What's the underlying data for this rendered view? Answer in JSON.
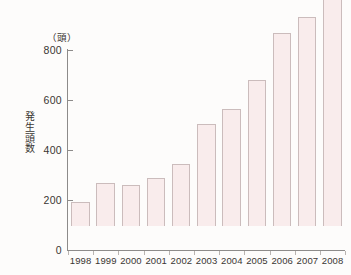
{
  "chart_data": {
    "type": "bar",
    "title": "",
    "subtitle": "",
    "xlabel": "",
    "ylabel": "発生頭数",
    "unit_label": "（頭）",
    "categories": [
      "1998",
      "1999",
      "2000",
      "2001",
      "2002",
      "2003",
      "2004",
      "2005",
      "2006",
      "2007",
      "2008"
    ],
    "values": [
      98,
      172,
      163,
      193,
      249,
      408,
      467,
      585,
      772,
      835,
      950
    ],
    "ylim": [
      0,
      1000
    ],
    "y_ticks": [
      0,
      200,
      400,
      600,
      800
    ],
    "y_tick_labels": [
      "0",
      "200",
      "400",
      "600",
      "800"
    ],
    "grid": false,
    "legend": false,
    "legend_position": "none",
    "series": [
      {
        "name": "発生頭数",
        "values": [
          98,
          172,
          163,
          193,
          249,
          408,
          467,
          585,
          772,
          835,
          950
        ]
      }
    ],
    "colors": {
      "bar_fill": "#f9ecec",
      "bar_border": "#cbbcbc",
      "axis": "#8d8b8a",
      "text": "#3a3633",
      "background": "#fdfcfb"
    }
  },
  "axis": {
    "y_title_chars": [
      "発",
      "生",
      "頭",
      "数"
    ]
  }
}
